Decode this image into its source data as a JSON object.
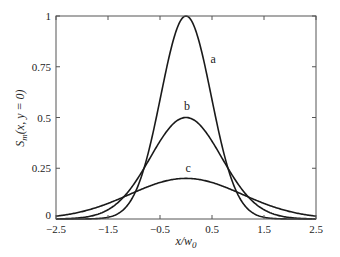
{
  "chart_data": {
    "type": "line",
    "title": "",
    "xlabel": "x/w0",
    "xlabel_main": "x/w",
    "xlabel_sub": "0",
    "ylabel": "S_m(x, y = 0)",
    "ylabel_main": "S",
    "ylabel_sub": "m",
    "ylabel_rest": "(x, y = 0)",
    "xlim": [
      -2.5,
      2.5
    ],
    "ylim": [
      0,
      1
    ],
    "xticks": [
      -2.5,
      -1.5,
      -0.5,
      0.5,
      1.5,
      2.5
    ],
    "xtick_labels": [
      "−2.5",
      "−1.5",
      "−0.5",
      "0.5",
      "1.5",
      "2.5"
    ],
    "yticks": [
      0,
      0.25,
      0.5,
      0.75,
      1
    ],
    "ytick_labels": [
      "0",
      "0.25",
      "0.5",
      "0.75",
      "1"
    ],
    "grid": false,
    "legend": "inline labels",
    "series": [
      {
        "name": "a",
        "form": "peak*exp(-x^2/s2)",
        "peak": 1.0,
        "s2": 0.47,
        "x": [
          -2.5,
          -2.0,
          -1.5,
          -1.0,
          -0.75,
          -0.5,
          -0.25,
          0,
          0.25,
          0.5,
          0.75,
          1.0,
          1.5,
          2.0,
          2.5
        ],
        "values": [
          0.0,
          0.0002,
          0.008,
          0.119,
          0.302,
          0.588,
          0.876,
          1.0,
          0.876,
          0.588,
          0.302,
          0.119,
          0.008,
          0.0002,
          0.0
        ],
        "label_pos": [
          0.52,
          0.79
        ]
      },
      {
        "name": "b",
        "form": "peak*exp(-x^2/s2)",
        "peak": 0.5,
        "s2": 0.94,
        "x": [
          -2.5,
          -2.0,
          -1.5,
          -1.0,
          -0.75,
          -0.5,
          -0.25,
          0,
          0.25,
          0.5,
          0.75,
          1.0,
          1.5,
          2.0,
          2.5
        ],
        "values": [
          0.001,
          0.007,
          0.046,
          0.172,
          0.275,
          0.383,
          0.468,
          0.5,
          0.468,
          0.383,
          0.275,
          0.172,
          0.046,
          0.007,
          0.001
        ],
        "label_pos": [
          0.02,
          0.555
        ]
      },
      {
        "name": "c",
        "form": "peak*exp(-x^2/s2)",
        "peak": 0.2,
        "s2": 2.35,
        "x": [
          -2.5,
          -2.0,
          -1.5,
          -1.0,
          -0.75,
          -0.5,
          -0.25,
          0,
          0.25,
          0.5,
          0.75,
          1.0,
          1.5,
          2.0,
          2.5
        ],
        "values": [
          0.014,
          0.036,
          0.077,
          0.131,
          0.157,
          0.179,
          0.195,
          0.2,
          0.195,
          0.179,
          0.157,
          0.131,
          0.077,
          0.036,
          0.014
        ],
        "label_pos": [
          0.04,
          0.25
        ]
      }
    ]
  },
  "style": {
    "line_color": "#1a1a1a",
    "axis_color": "#555555",
    "background": "#ffffff"
  }
}
